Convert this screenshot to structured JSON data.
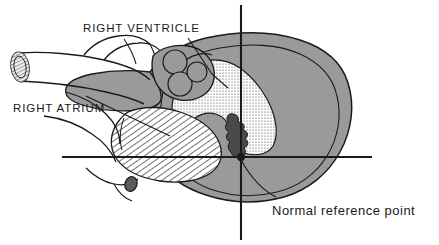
{
  "figure": {
    "background_color": "#ffffff",
    "ink_color": "#1a1a1a",
    "width": 439,
    "height": 245
  },
  "labels": {
    "right_ventricle": "RIGHT VENTRICLE",
    "right_atrium": "RIGHT ATRIUM",
    "normal_reference_point": "Normal reference point"
  },
  "axes": {
    "horizontal": {
      "x_start": 62,
      "x_end": 372,
      "y": 157
    },
    "vertical": {
      "x": 241,
      "y_start": 5,
      "y_end": 240
    },
    "origin": {
      "x": 241,
      "y": 157,
      "marker": "filled-dot"
    }
  },
  "regions": {
    "myocardium": {
      "name": "myocardium-outer-wall",
      "fill": "#9a9a9a",
      "pattern": "solid-gray"
    },
    "right_ventricle_cavity": {
      "name": "right-ventricle-cavity",
      "fill": "#ffffff",
      "pattern": "stipple-dots"
    },
    "right_atrium_cavity": {
      "name": "right-atrium-cavity",
      "fill": "#ffffff",
      "pattern": "diagonal-hatch"
    },
    "great_vessels": {
      "name": "great-vessels",
      "fill": "#ffffff",
      "pattern": "outline-only"
    },
    "valve_cusps": {
      "name": "pulmonary-valve-cusps",
      "count": 3,
      "fill": "#9a9a9a"
    },
    "tricuspid_valve": {
      "name": "tricuspid-valve-leaflet",
      "fill": "#4a4a4a",
      "pattern": "dark-wavy"
    },
    "coronary_stub": {
      "name": "coronary-vessel-stub",
      "fill": "#5a5a5a"
    }
  }
}
